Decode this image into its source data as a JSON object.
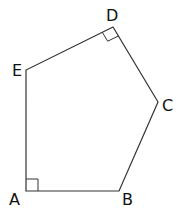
{
  "diagram": {
    "type": "pentagon",
    "stroke_color": "#333333",
    "vertices": [
      {
        "name": "A",
        "x": 26,
        "y": 191
      },
      {
        "name": "B",
        "x": 119,
        "y": 191
      },
      {
        "name": "C",
        "x": 158,
        "y": 102
      },
      {
        "name": "D",
        "x": 113,
        "y": 27
      },
      {
        "name": "E",
        "x": 26,
        "y": 70
      }
    ],
    "labels": {
      "A": "A",
      "B": "B",
      "C": "C",
      "D": "D",
      "E": "E"
    },
    "right_angles": [
      "A",
      "D"
    ]
  }
}
